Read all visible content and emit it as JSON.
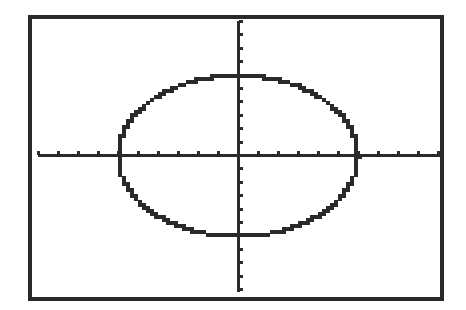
{
  "chart_data": {
    "type": "line",
    "title": "",
    "xlabel": "",
    "ylabel": "",
    "xlim": [
      -10,
      10
    ],
    "ylim": [
      -10,
      10
    ],
    "xscale": 1,
    "yscale": 1,
    "grid": false,
    "equation": "x^2 + y^2 = 36",
    "series": [
      {
        "name": "ellipse",
        "shape": "ellipse",
        "center": [
          0,
          0
        ],
        "rx": 6,
        "ry": 6,
        "color": "#2a2a2a"
      }
    ]
  },
  "screen": {
    "frame_color": "#2a2a2a",
    "background": "#ffffff"
  }
}
